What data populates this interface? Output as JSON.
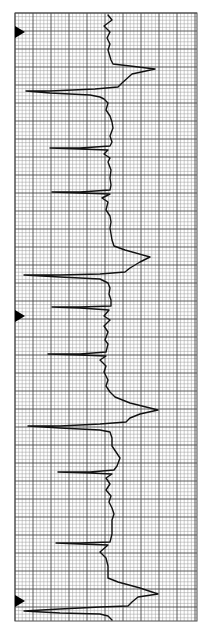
{
  "figure": {
    "colors": {
      "background": "#ffffff",
      "grid_minor": "#9a9a9a",
      "grid_major": "#4a4a4a",
      "trace": "#111111",
      "marker": "#000000"
    },
    "grid": {
      "left": 15,
      "top": 13,
      "right": 197,
      "bottom": 621,
      "minor_step": 3.6,
      "major_every": 5
    },
    "markers": [
      {
        "name": "marker-1",
        "y": 32
      },
      {
        "name": "marker-2",
        "y": 316
      },
      {
        "name": "marker-3",
        "y": 601
      }
    ],
    "trace_points": "108,15 112,20 104,26 110,32 107,38 110,44 108,50 111,60 113,64 130,66 155,69 132,74 122,83 118,87 95,89 50,91 26,91 50,93 90,95 100,97 104,99 108,103 106,110 110,116 112,122 113,128 110,136 112,142 110,146 80,148 50,148 80,149 108,150 104,154 110,158 108,162 111,170 110,178 111,185 110,190 80,192 52,192 80,193 110,194 102,198 108,202 106,210 110,216 111,222 110,228 112,240 114,246 125,250 150,257 140,262 130,268 125,272 100,274 60,275 24,275 60,277 100,279 108,283 110,288 109,294 111,300 111,306 80,307 52,307 80,308 109,310 104,316 110,320 104,326 108,332 105,340 108,344 106,352 80,354 48,354 80,355 106,356 100,360 106,366 104,372 108,380 106,386 110,392 115,397 130,403 158,410 140,414 130,418 126,422 100,424 60,426 28,426 60,428 100,430 110,432 112,438 112,446 116,452 120,458 117,466 114,470 90,472 58,472 90,473 112,474 106,478 110,484 106,490 111,496 109,502 112,508 114,514 112,520 112,534 110,542 80,543 56,543 80,544 108,545 100,552 106,558 108,566 108,574 108,578 118,582 140,588 158,594 138,597 132,602 128,606 100,607 60,609 24,611 60,613 100,614 108,616 112,620 111,628 113,636 111,640 108,646 98,643",
    "trace_points_note": "y increases downward; x is amplitude direction"
  }
}
